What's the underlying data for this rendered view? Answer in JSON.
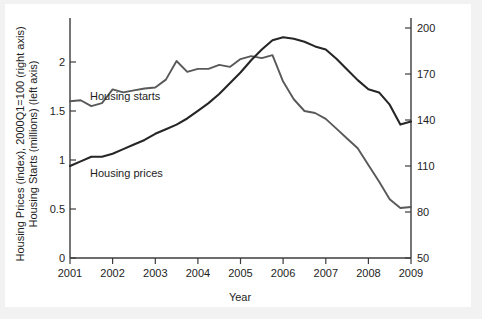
{
  "chart_data": {
    "type": "line",
    "title": "",
    "xlabel": "Year",
    "ylabel_left": "Housing Prices (index), 2000Q1=100 (right axis)",
    "ylabel_left2": "Housing Starts (millions) (left axis)",
    "grid": false,
    "legend_position": "inline-annotation",
    "x": [
      2001.0,
      2001.25,
      2001.5,
      2001.75,
      2002.0,
      2002.25,
      2002.5,
      2002.75,
      2003.0,
      2003.25,
      2003.5,
      2003.75,
      2004.0,
      2004.25,
      2004.5,
      2004.75,
      2005.0,
      2005.25,
      2005.5,
      2005.75,
      2006.0,
      2006.25,
      2006.5,
      2006.75,
      2007.0,
      2007.25,
      2007.5,
      2007.75,
      2008.0,
      2008.25,
      2008.5,
      2008.75,
      2009.0
    ],
    "xlim": [
      2001,
      2009
    ],
    "xticks": [
      "2001",
      "2002",
      "2003",
      "2004",
      "2005",
      "2006",
      "2007",
      "2008",
      "2009"
    ],
    "left_axis": {
      "label": "Housing Starts (millions) (left axis)",
      "ticks": [
        "0",
        "0.5",
        "1",
        "1.5",
        "2"
      ],
      "tick_values": [
        0,
        0.5,
        1,
        1.5,
        2
      ],
      "ylim": [
        0,
        2.45
      ]
    },
    "right_axis": {
      "label": "Housing Prices (index), 2000Q1=100 (right axis)",
      "ticks": [
        "50",
        "80",
        "110",
        "140",
        "170",
        "200"
      ],
      "tick_values": [
        50,
        80,
        110,
        140,
        170,
        200
      ],
      "ylim": [
        50,
        206
      ]
    },
    "series": [
      {
        "name": "Housing starts",
        "axis": "left",
        "units": "millions",
        "color": "#595959",
        "label_text": "Housing starts",
        "values": [
          1.6,
          1.61,
          1.55,
          1.58,
          1.72,
          1.69,
          1.71,
          1.73,
          1.74,
          1.82,
          2.01,
          1.9,
          1.93,
          1.93,
          1.97,
          1.95,
          2.03,
          2.06,
          2.04,
          2.07,
          1.8,
          1.62,
          1.5,
          1.48,
          1.42,
          1.32,
          1.22,
          1.12,
          0.95,
          0.78,
          0.6,
          0.51,
          0.52
        ]
      },
      {
        "name": "Housing prices",
        "axis": "right",
        "units": "index, 2000Q1=100",
        "color": "#262626",
        "label_text": "Housing prices",
        "values": [
          110,
          113,
          116,
          116,
          118,
          121,
          124,
          127,
          131,
          134,
          137,
          141,
          146,
          151,
          157,
          164,
          171,
          179,
          186,
          192,
          194,
          193,
          191,
          188,
          186,
          180,
          173,
          166,
          160,
          158,
          150,
          137,
          139
        ]
      }
    ]
  },
  "axis_titles": {
    "x": "Year",
    "y_line1": "Housing Prices (index), 2000Q1=100 (right axis)",
    "y_line2": "Housing Starts (millions) (left axis)"
  }
}
